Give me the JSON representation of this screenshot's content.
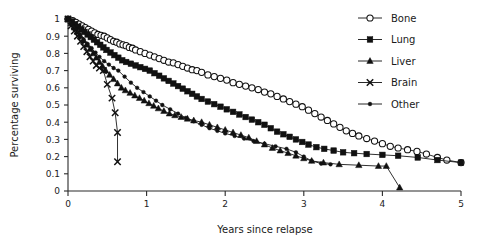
{
  "chart_data": {
    "type": "line",
    "title": "",
    "subtitle": "",
    "xlabel": "Years since relapse",
    "ylabel": "Percentage surviving",
    "xlim": [
      0,
      5
    ],
    "ylim": [
      0,
      1
    ],
    "xticks": [
      "0",
      "1",
      "2",
      "3",
      "4",
      "5"
    ],
    "yticks": [
      "0",
      "0.1",
      "0.2",
      "0.3",
      "0.4",
      "0.5",
      "0.6",
      "0.7",
      "0.8",
      "0.9",
      "1"
    ],
    "grid": false,
    "legend_position": "top-right",
    "legend_entries": [
      "Bone",
      "Lung",
      "Liver",
      "Brain",
      "Other"
    ],
    "annotations": [],
    "series": [
      {
        "name": "Bone",
        "marker": "open-circle",
        "color": "#111111",
        "points": [
          [
            0.0,
            1.0
          ],
          [
            0.06,
            0.99
          ],
          [
            0.1,
            0.98
          ],
          [
            0.14,
            0.97
          ],
          [
            0.18,
            0.96
          ],
          [
            0.22,
            0.95
          ],
          [
            0.26,
            0.94
          ],
          [
            0.3,
            0.93
          ],
          [
            0.34,
            0.92
          ],
          [
            0.38,
            0.91
          ],
          [
            0.42,
            0.905
          ],
          [
            0.46,
            0.9
          ],
          [
            0.5,
            0.89
          ],
          [
            0.54,
            0.88
          ],
          [
            0.58,
            0.87
          ],
          [
            0.62,
            0.865
          ],
          [
            0.66,
            0.855
          ],
          [
            0.7,
            0.85
          ],
          [
            0.74,
            0.845
          ],
          [
            0.78,
            0.835
          ],
          [
            0.82,
            0.83
          ],
          [
            0.86,
            0.82
          ],
          [
            0.92,
            0.81
          ],
          [
            0.98,
            0.8
          ],
          [
            1.04,
            0.79
          ],
          [
            1.1,
            0.78
          ],
          [
            1.16,
            0.77
          ],
          [
            1.22,
            0.76
          ],
          [
            1.28,
            0.75
          ],
          [
            1.34,
            0.745
          ],
          [
            1.4,
            0.735
          ],
          [
            1.46,
            0.725
          ],
          [
            1.52,
            0.715
          ],
          [
            1.58,
            0.705
          ],
          [
            1.64,
            0.7
          ],
          [
            1.7,
            0.69
          ],
          [
            1.78,
            0.675
          ],
          [
            1.86,
            0.665
          ],
          [
            1.94,
            0.655
          ],
          [
            2.02,
            0.645
          ],
          [
            2.1,
            0.63
          ],
          [
            2.18,
            0.62
          ],
          [
            2.26,
            0.61
          ],
          [
            2.34,
            0.6
          ],
          [
            2.42,
            0.59
          ],
          [
            2.5,
            0.575
          ],
          [
            2.58,
            0.565
          ],
          [
            2.66,
            0.55
          ],
          [
            2.74,
            0.535
          ],
          [
            2.82,
            0.52
          ],
          [
            2.9,
            0.505
          ],
          [
            2.98,
            0.49
          ],
          [
            3.06,
            0.47
          ],
          [
            3.14,
            0.45
          ],
          [
            3.22,
            0.43
          ],
          [
            3.3,
            0.41
          ],
          [
            3.38,
            0.39
          ],
          [
            3.46,
            0.37
          ],
          [
            3.54,
            0.35
          ],
          [
            3.62,
            0.335
          ],
          [
            3.7,
            0.32
          ],
          [
            3.8,
            0.305
          ],
          [
            3.9,
            0.29
          ],
          [
            4.0,
            0.275
          ],
          [
            4.1,
            0.26
          ],
          [
            4.2,
            0.25
          ],
          [
            4.32,
            0.24
          ],
          [
            4.44,
            0.23
          ],
          [
            4.56,
            0.215
          ],
          [
            4.7,
            0.195
          ],
          [
            4.82,
            0.18
          ],
          [
            5.0,
            0.165
          ]
        ]
      },
      {
        "name": "Lung",
        "marker": "filled-square",
        "color": "#111111",
        "points": [
          [
            0.0,
            1.0
          ],
          [
            0.05,
            0.985
          ],
          [
            0.09,
            0.97
          ],
          [
            0.13,
            0.955
          ],
          [
            0.17,
            0.94
          ],
          [
            0.21,
            0.925
          ],
          [
            0.25,
            0.91
          ],
          [
            0.29,
            0.895
          ],
          [
            0.33,
            0.88
          ],
          [
            0.37,
            0.865
          ],
          [
            0.41,
            0.85
          ],
          [
            0.45,
            0.835
          ],
          [
            0.49,
            0.82
          ],
          [
            0.54,
            0.805
          ],
          [
            0.59,
            0.79
          ],
          [
            0.64,
            0.775
          ],
          [
            0.69,
            0.76
          ],
          [
            0.74,
            0.75
          ],
          [
            0.8,
            0.74
          ],
          [
            0.86,
            0.73
          ],
          [
            0.92,
            0.72
          ],
          [
            0.98,
            0.71
          ],
          [
            1.04,
            0.7
          ],
          [
            1.1,
            0.685
          ],
          [
            1.16,
            0.67
          ],
          [
            1.22,
            0.655
          ],
          [
            1.28,
            0.64
          ],
          [
            1.34,
            0.625
          ],
          [
            1.4,
            0.61
          ],
          [
            1.46,
            0.595
          ],
          [
            1.52,
            0.58
          ],
          [
            1.58,
            0.565
          ],
          [
            1.64,
            0.55
          ],
          [
            1.7,
            0.535
          ],
          [
            1.78,
            0.52
          ],
          [
            1.86,
            0.505
          ],
          [
            1.94,
            0.49
          ],
          [
            2.02,
            0.475
          ],
          [
            2.1,
            0.46
          ],
          [
            2.18,
            0.445
          ],
          [
            2.26,
            0.43
          ],
          [
            2.34,
            0.415
          ],
          [
            2.42,
            0.4
          ],
          [
            2.5,
            0.385
          ],
          [
            2.58,
            0.365
          ],
          [
            2.66,
            0.345
          ],
          [
            2.74,
            0.33
          ],
          [
            2.82,
            0.315
          ],
          [
            2.9,
            0.3
          ],
          [
            2.98,
            0.285
          ],
          [
            3.06,
            0.27
          ],
          [
            3.16,
            0.255
          ],
          [
            3.26,
            0.245
          ],
          [
            3.38,
            0.235
          ],
          [
            3.5,
            0.225
          ],
          [
            3.64,
            0.22
          ],
          [
            3.8,
            0.215
          ],
          [
            4.0,
            0.21
          ],
          [
            4.2,
            0.205
          ],
          [
            4.45,
            0.195
          ],
          [
            4.7,
            0.18
          ],
          [
            5.0,
            0.165
          ]
        ]
      },
      {
        "name": "Liver",
        "marker": "filled-triangle",
        "color": "#111111",
        "points": [
          [
            0.0,
            1.0
          ],
          [
            0.04,
            0.975
          ],
          [
            0.08,
            0.95
          ],
          [
            0.12,
            0.925
          ],
          [
            0.16,
            0.9
          ],
          [
            0.2,
            0.875
          ],
          [
            0.24,
            0.85
          ],
          [
            0.28,
            0.825
          ],
          [
            0.32,
            0.8
          ],
          [
            0.36,
            0.775
          ],
          [
            0.4,
            0.75
          ],
          [
            0.44,
            0.725
          ],
          [
            0.48,
            0.7
          ],
          [
            0.53,
            0.675
          ],
          [
            0.58,
            0.65
          ],
          [
            0.63,
            0.625
          ],
          [
            0.68,
            0.6
          ],
          [
            0.73,
            0.585
          ],
          [
            0.79,
            0.57
          ],
          [
            0.85,
            0.555
          ],
          [
            0.91,
            0.54
          ],
          [
            0.97,
            0.525
          ],
          [
            1.03,
            0.51
          ],
          [
            1.09,
            0.495
          ],
          [
            1.15,
            0.48
          ],
          [
            1.22,
            0.465
          ],
          [
            1.29,
            0.45
          ],
          [
            1.36,
            0.44
          ],
          [
            1.44,
            0.43
          ],
          [
            1.52,
            0.42
          ],
          [
            1.6,
            0.41
          ],
          [
            1.7,
            0.4
          ],
          [
            1.8,
            0.385
          ],
          [
            1.9,
            0.37
          ],
          [
            2.0,
            0.355
          ],
          [
            2.1,
            0.34
          ],
          [
            2.2,
            0.325
          ],
          [
            2.3,
            0.31
          ],
          [
            2.4,
            0.29
          ],
          [
            2.5,
            0.27
          ],
          [
            2.6,
            0.25
          ],
          [
            2.7,
            0.235
          ],
          [
            2.8,
            0.22
          ],
          [
            2.9,
            0.205
          ],
          [
            3.0,
            0.19
          ],
          [
            3.1,
            0.175
          ],
          [
            3.25,
            0.165
          ],
          [
            3.45,
            0.155
          ],
          [
            3.7,
            0.15
          ],
          [
            3.95,
            0.145
          ],
          [
            4.05,
            0.145
          ],
          [
            4.22,
            0.02
          ]
        ]
      },
      {
        "name": "Brain",
        "marker": "cross-x",
        "color": "#111111",
        "points": [
          [
            0.0,
            1.0
          ],
          [
            0.04,
            0.96
          ],
          [
            0.08,
            0.93
          ],
          [
            0.12,
            0.9
          ],
          [
            0.16,
            0.87
          ],
          [
            0.2,
            0.84
          ],
          [
            0.24,
            0.81
          ],
          [
            0.28,
            0.78
          ],
          [
            0.32,
            0.755
          ],
          [
            0.36,
            0.73
          ],
          [
            0.4,
            0.715
          ],
          [
            0.45,
            0.7
          ],
          [
            0.5,
            0.62
          ],
          [
            0.56,
            0.54
          ],
          [
            0.6,
            0.455
          ],
          [
            0.63,
            0.34
          ],
          [
            0.63,
            0.17
          ]
        ]
      },
      {
        "name": "Other",
        "marker": "filled-circle-small",
        "color": "#111111",
        "points": [
          [
            0.0,
            1.0
          ],
          [
            0.05,
            0.97
          ],
          [
            0.1,
            0.94
          ],
          [
            0.15,
            0.91
          ],
          [
            0.2,
            0.88
          ],
          [
            0.25,
            0.855
          ],
          [
            0.3,
            0.83
          ],
          [
            0.35,
            0.805
          ],
          [
            0.4,
            0.78
          ],
          [
            0.46,
            0.755
          ],
          [
            0.52,
            0.735
          ],
          [
            0.58,
            0.715
          ],
          [
            0.64,
            0.7
          ],
          [
            0.72,
            0.665
          ],
          [
            0.8,
            0.63
          ],
          [
            0.88,
            0.6
          ],
          [
            0.96,
            0.575
          ],
          [
            1.04,
            0.55
          ],
          [
            1.12,
            0.525
          ],
          [
            1.2,
            0.5
          ],
          [
            1.3,
            0.475
          ],
          [
            1.4,
            0.45
          ],
          [
            1.5,
            0.425
          ],
          [
            1.6,
            0.405
          ],
          [
            1.7,
            0.385
          ],
          [
            1.8,
            0.365
          ],
          [
            1.9,
            0.35
          ],
          [
            2.0,
            0.335
          ],
          [
            2.12,
            0.32
          ],
          [
            2.24,
            0.305
          ],
          [
            2.36,
            0.29
          ],
          [
            2.5,
            0.275
          ],
          [
            2.64,
            0.26
          ],
          [
            2.78,
            0.245
          ],
          [
            2.9,
            0.225
          ],
          [
            3.0,
            0.2
          ],
          [
            3.1,
            0.175
          ],
          [
            3.22,
            0.16
          ],
          [
            3.34,
            0.155
          ]
        ]
      }
    ]
  },
  "axes": {
    "x_title": "Years since relapse",
    "y_title": "Percentage surviving"
  },
  "legend": {
    "items": [
      {
        "label": "Bone",
        "marker": "open-circle"
      },
      {
        "label": "Lung",
        "marker": "filled-square"
      },
      {
        "label": "Liver",
        "marker": "filled-triangle"
      },
      {
        "label": "Brain",
        "marker": "cross-x"
      },
      {
        "label": "Other",
        "marker": "filled-circle-small"
      }
    ]
  }
}
